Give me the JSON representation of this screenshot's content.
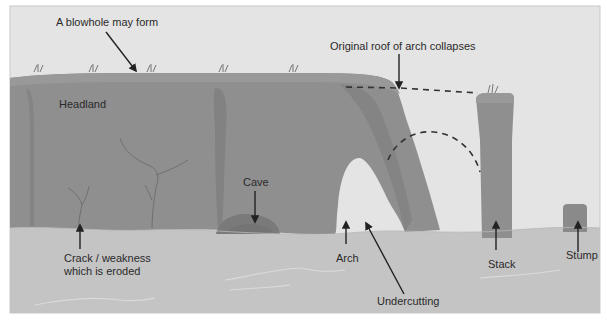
{
  "diagram": {
    "colors": {
      "sky": "#e4e4e4",
      "frame": "#c8c8c8",
      "rock": "#8f8f8f",
      "rock_dark": "#7f7f7f",
      "rock_top": "#999999",
      "sea": "#c4c4c4",
      "wave": "#d8d8d8",
      "arrow": "#222222",
      "dashed": "#333333",
      "grass": "#6a6a6a"
    },
    "labels": {
      "blowhole": "A blowhole may form",
      "roof": "Original roof of arch collapses",
      "headland": "Headland",
      "cave": "Cave",
      "crack_line1": "Crack / weakness",
      "crack_line2": "which is eroded",
      "arch": "Arch",
      "undercutting": "Undercutting",
      "stack": "Stack",
      "stump": "Stump"
    }
  }
}
